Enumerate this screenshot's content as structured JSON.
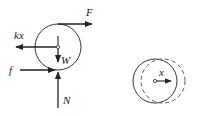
{
  "diagram": {
    "free_body": {
      "labels": {
        "applied_force": "F",
        "spring_force": "kx",
        "friction": "f",
        "weight": "W",
        "normal": "N"
      }
    },
    "displacement": {
      "labels": {
        "displacement": "x"
      }
    },
    "colors": {
      "stroke": "#222222",
      "dashed": "#555555",
      "background": "#ffffff"
    }
  }
}
